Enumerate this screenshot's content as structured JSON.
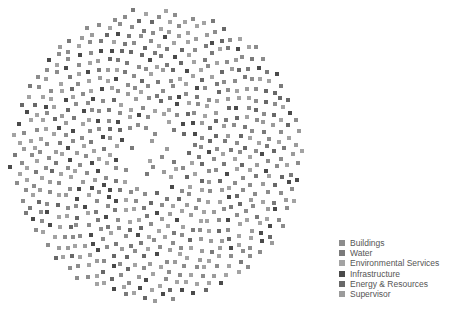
{
  "chart_data": {
    "type": "scatter",
    "title": "",
    "layout": {
      "center_x": 157,
      "center_y": 155,
      "radius_x": 146,
      "radius_y": 146,
      "node_count": 720,
      "inner_hole_radius": 35,
      "node_size": 4
    },
    "legend_position": "bottom-right",
    "categories": [
      {
        "name": "Buildings",
        "color": "#8c8c8c",
        "weight": 0.3
      },
      {
        "name": "Water",
        "color": "#7a7a7a",
        "weight": 0.12
      },
      {
        "name": "Environmental Services",
        "color": "#a3a3a3",
        "weight": 0.25
      },
      {
        "name": "Infrastructure",
        "color": "#4a4a4a",
        "weight": 0.12
      },
      {
        "name": "Energy & Resources",
        "color": "#686868",
        "weight": 0.11
      },
      {
        "name": "Supervisor",
        "color": "#9b9b9b",
        "weight": 0.1
      }
    ]
  },
  "legend": {
    "items": [
      {
        "label": "Buildings",
        "color": "#8c8c8c"
      },
      {
        "label": "Water",
        "color": "#7a7a7a"
      },
      {
        "label": "Environmental Services",
        "color": "#a3a3a3"
      },
      {
        "label": "Infrastructure",
        "color": "#4a4a4a"
      },
      {
        "label": "Energy & Resources",
        "color": "#686868"
      },
      {
        "label": "Supervisor",
        "color": "#9b9b9b"
      }
    ]
  }
}
